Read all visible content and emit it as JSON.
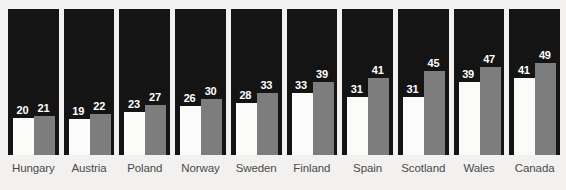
{
  "chart_data": {
    "type": "bar",
    "title": "",
    "subtitle": "",
    "xlabel": "",
    "ylabel": "",
    "ylim": [
      0,
      52
    ],
    "grid": false,
    "legend_position": "none",
    "orientation": "vertical",
    "layout": "small-multiples-panels",
    "categories": [
      "Hungary",
      "Austria",
      "Poland",
      "Norway",
      "Sweden",
      "Finland",
      "Spain",
      "Scotland",
      "Wales",
      "Canada"
    ],
    "series": [
      {
        "name": "series-1",
        "color": "#fbfbf9",
        "values": [
          20,
          19,
          23,
          26,
          28,
          33,
          31,
          31,
          39,
          41
        ]
      },
      {
        "name": "series-2",
        "color": "#7d7d7d",
        "values": [
          21,
          22,
          27,
          30,
          33,
          39,
          41,
          45,
          47,
          49
        ]
      }
    ],
    "panel_background": "#141414",
    "page_background": "#f2f1ef",
    "value_label_color": "#ffffff",
    "category_label_color": "#4a4a4a",
    "panels": [
      {
        "category": "Hungary",
        "first": 20,
        "second": 21
      },
      {
        "category": "Austria",
        "first": 19,
        "second": 22
      },
      {
        "category": "Poland",
        "first": 23,
        "second": 27
      },
      {
        "category": "Norway",
        "first": 26,
        "second": 30
      },
      {
        "category": "Sweden",
        "first": 28,
        "second": 33
      },
      {
        "category": "Finland",
        "first": 33,
        "second": 39
      },
      {
        "category": "Spain",
        "first": 31,
        "second": 41
      },
      {
        "category": "Scotland",
        "first": 31,
        "second": 45
      },
      {
        "category": "Wales",
        "first": 39,
        "second": 47
      },
      {
        "category": "Canada",
        "first": 41,
        "second": 49
      }
    ]
  }
}
